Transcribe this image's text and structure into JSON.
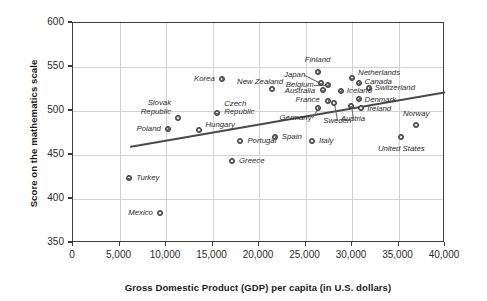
{
  "chart_data": {
    "type": "scatter",
    "title": "",
    "xlabel": "Gross Domestic Product (GDP) per capita (in U.S. dollars)",
    "ylabel": "Score on the mathematics scale",
    "xlim": [
      0,
      40000
    ],
    "ylim": [
      350,
      600
    ],
    "xticks": [
      "0",
      "5,000",
      "10,000",
      "15,000",
      "20,000",
      "25,000",
      "30,000",
      "35,000",
      "40,000"
    ],
    "xtick_values": [
      0,
      5000,
      10000,
      15000,
      20000,
      25000,
      30000,
      35000,
      40000
    ],
    "yticks": [
      "350",
      "400",
      "450",
      "500",
      "550",
      "600"
    ],
    "ytick_values": [
      350,
      400,
      450,
      500,
      550,
      600
    ],
    "grid": true,
    "legend": "none",
    "trendline": {
      "x0": 6100,
      "y0": 460,
      "x1": 40000,
      "y1": 522
    },
    "marker_color": "#6e6e6e",
    "marker_edge_color": "#3a3a3a",
    "grid_color": "#d2d2d2",
    "axis_color": "#3c3c3c",
    "points": [
      {
        "name": "Turkey",
        "x": 6050,
        "y": 424,
        "label_pos": "l",
        "label_dx": 7,
        "label_dy": 0
      },
      {
        "name": "Mexico",
        "x": 9350,
        "y": 384,
        "label_pos": "r",
        "label_dx": -7,
        "label_dy": 0
      },
      {
        "name": "Poland",
        "x": 10200,
        "y": 480,
        "label_pos": "r",
        "label_dx": -7,
        "label_dy": 0
      },
      {
        "name": "Slovak Republic",
        "x": 11300,
        "y": 492,
        "label_pos": "r",
        "label_dx": -7,
        "label_dy": -10
      },
      {
        "name": "Hungary",
        "x": 13600,
        "y": 478,
        "label_pos": "l",
        "label_dx": 6,
        "label_dy": -5
      },
      {
        "name": "Czech Republic",
        "x": 15500,
        "y": 498,
        "label_pos": "l",
        "label_dx": 7,
        "label_dy": -4
      },
      {
        "name": "Korea",
        "x": 16000,
        "y": 536,
        "label_pos": "r",
        "label_dx": -7,
        "label_dy": 0
      },
      {
        "name": "Greece",
        "x": 17100,
        "y": 443,
        "label_pos": "l",
        "label_dx": 7,
        "label_dy": 0
      },
      {
        "name": "Portugal",
        "x": 18000,
        "y": 466,
        "label_pos": "l",
        "label_dx": 7,
        "label_dy": 0
      },
      {
        "name": "New Zealand",
        "x": 21400,
        "y": 525,
        "label_pos": "r",
        "label_dx": -7,
        "label_dy": -7
      },
      {
        "name": "Spain",
        "x": 21700,
        "y": 470,
        "label_pos": "l",
        "label_dx": 7,
        "label_dy": 0
      },
      {
        "name": "Italy",
        "x": 25700,
        "y": 466,
        "label_pos": "l",
        "label_dx": 7,
        "label_dy": 0
      },
      {
        "name": "Finland",
        "x": 26300,
        "y": 544,
        "label_pos": "c",
        "label_dx": 0,
        "label_dy": -12
      },
      {
        "name": "Japan",
        "x": 26700,
        "y": 532,
        "label_pos": "r",
        "label_dx": -16,
        "label_dy": -8
      },
      {
        "name": "Belgium",
        "x": 27400,
        "y": 530,
        "label_pos": "r",
        "label_dx": -14,
        "label_dy": 0
      },
      {
        "name": "Australia",
        "x": 26900,
        "y": 524,
        "label_pos": "r",
        "label_dx": -8,
        "label_dy": 1
      },
      {
        "name": "France",
        "x": 27400,
        "y": 511,
        "label_pos": "r",
        "label_dx": -8,
        "label_dy": -1
      },
      {
        "name": "Germany",
        "x": 26300,
        "y": 503,
        "label_pos": "r",
        "label_dx": -6,
        "label_dy": 10
      },
      {
        "name": "Iceland",
        "x": 28800,
        "y": 523,
        "label_pos": "l",
        "label_dx": 6,
        "label_dy": 0
      },
      {
        "name": "Sweden",
        "x": 28100,
        "y": 509,
        "label_pos": "c",
        "label_dx": 3,
        "label_dy": 18
      },
      {
        "name": "Netherlands",
        "x": 30000,
        "y": 538,
        "label_pos": "l",
        "label_dx": 6,
        "label_dy": -5
      },
      {
        "name": "Canada",
        "x": 30700,
        "y": 532,
        "label_pos": "l",
        "label_dx": 6,
        "label_dy": -1
      },
      {
        "name": "Switzerland",
        "x": 31800,
        "y": 526,
        "label_pos": "l",
        "label_dx": 6,
        "label_dy": 0
      },
      {
        "name": "Denmark",
        "x": 30700,
        "y": 514,
        "label_pos": "l",
        "label_dx": 6,
        "label_dy": 1
      },
      {
        "name": "Austria",
        "x": 29900,
        "y": 506,
        "label_pos": "c",
        "label_dx": 2,
        "label_dy": 13
      },
      {
        "name": "Ireland",
        "x": 31000,
        "y": 503,
        "label_pos": "l",
        "label_dx": 6,
        "label_dy": 1
      },
      {
        "name": "United States",
        "x": 35300,
        "y": 470,
        "label_pos": "c",
        "label_dx": 0,
        "label_dy": 12
      },
      {
        "name": "Norway",
        "x": 36900,
        "y": 484,
        "label_pos": "c",
        "label_dx": 0,
        "label_dy": -11
      }
    ],
    "leaders": [
      {
        "from_name": "Japan",
        "x1": 26700,
        "y1": 532
      },
      {
        "from_name": "Belgium",
        "x1": 27400,
        "y1": 530
      },
      {
        "from_name": "Sweden",
        "x1": 28100,
        "y1": 509
      },
      {
        "from_name": "Austria",
        "x1": 29900,
        "y1": 506
      },
      {
        "from_name": "Germany",
        "x1": 26300,
        "y1": 503
      }
    ]
  }
}
